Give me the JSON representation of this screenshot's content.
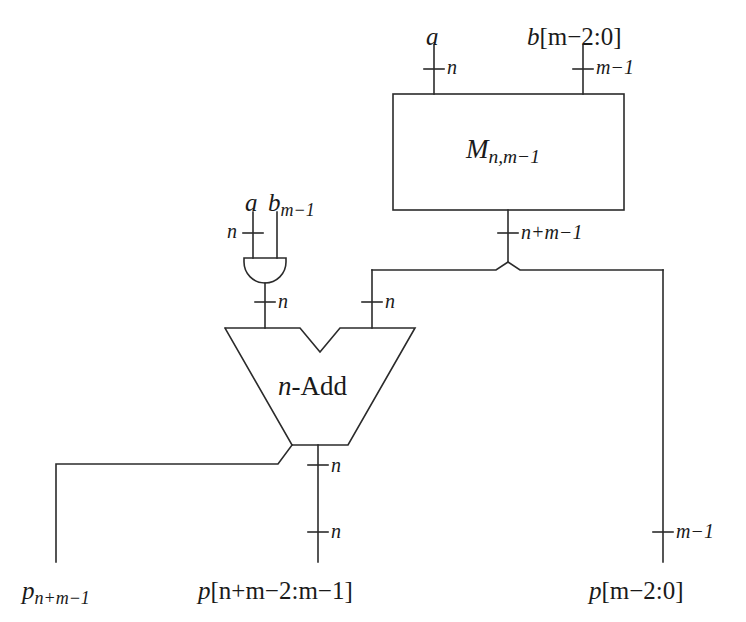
{
  "figure": {
    "type": "logic-circuit-diagram",
    "stroke_color": "#2b2b2b",
    "background_color": "#ffffff"
  },
  "blocks": {
    "multiplier": {
      "name": "multiplier-block",
      "label_main": "M",
      "label_sub": "n,m−1",
      "label_full": "M n,m−1"
    },
    "and_gate": {
      "name": "and-gate",
      "label": ""
    },
    "adder": {
      "name": "n-bit-adder",
      "label_italic": "n",
      "label_rest": "-Add",
      "label_full": "n-Add"
    }
  },
  "inputs": {
    "mult_a": {
      "label": "a",
      "width": "n"
    },
    "mult_b": {
      "label_main": "b",
      "label_bracket": "[m−2:0]",
      "label_full": "b[m−2:0]",
      "width": "m−1"
    },
    "and_a": {
      "label": "a",
      "width": "n"
    },
    "and_b": {
      "label_main": "b",
      "label_sub": "m−1",
      "label_full": "b m−1",
      "width": ""
    }
  },
  "buses": {
    "mult_out": {
      "width": "n+m−1"
    },
    "and_out": {
      "width": "n"
    },
    "adder_in_left": {
      "width": "n"
    },
    "adder_in_right": {
      "width": "n"
    },
    "adder_out_upper": {
      "width": "n"
    },
    "adder_out_lower": {
      "width": "n"
    },
    "low_bits": {
      "width": "m−1"
    }
  },
  "outputs": {
    "carry": {
      "label_main": "p",
      "label_sub": "n+m−1",
      "label_full": "p n+m−1"
    },
    "sum": {
      "label_main": "p",
      "label_bracket": "[n+m−2:m−1]",
      "label_full": "p[n+m−2:m−1]"
    },
    "low": {
      "label_main": "p",
      "label_bracket": "[m−2:0]",
      "label_full": "p[m−2:0]"
    }
  }
}
